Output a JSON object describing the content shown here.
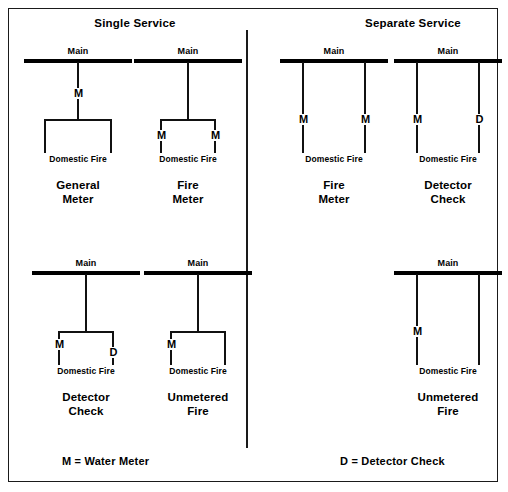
{
  "frame": {
    "border_color": "#1a1a1a",
    "background": "#ffffff"
  },
  "headers": {
    "single": "Single Service",
    "separate": "Separate Service"
  },
  "legend": {
    "meter": "M = Water Meter",
    "detector": "D = Detector Check"
  },
  "labels": {
    "main": "Main",
    "domestic_fire": "Domestic Fire",
    "meter_badge": "M",
    "detector_badge": "D"
  },
  "diagrams": [
    {
      "id": "general-meter",
      "group": "single",
      "caption_line1": "General",
      "caption_line2": "Meter",
      "main_label": "Main",
      "leg_caption": "Domestic Fire",
      "topology": "single-drop-split",
      "badges": [
        "M"
      ]
    },
    {
      "id": "fire-meter-single",
      "group": "single",
      "caption_line1": "Fire",
      "caption_line2": "Meter",
      "main_label": "Main",
      "leg_caption": "Domestic Fire",
      "topology": "single-drop-split",
      "badges": [
        "M",
        "M"
      ]
    },
    {
      "id": "fire-meter-separate",
      "group": "separate",
      "caption_line1": "Fire",
      "caption_line2": "Meter",
      "main_label": "Main",
      "leg_caption": "Domestic Fire",
      "topology": "two-independent-drops",
      "badges": [
        "M",
        "M"
      ]
    },
    {
      "id": "detector-check-separate",
      "group": "separate",
      "caption_line1": "Detector",
      "caption_line2": "Check",
      "main_label": "Main",
      "leg_caption": "Domestic Fire",
      "topology": "two-independent-drops",
      "badges": [
        "M",
        "D"
      ]
    },
    {
      "id": "detector-check-single",
      "group": "single",
      "caption_line1": "Detector",
      "caption_line2": "Check",
      "main_label": "Main",
      "leg_caption": "Domestic Fire",
      "topology": "single-drop-split",
      "badges": [
        "M",
        "D"
      ]
    },
    {
      "id": "unmetered-fire-single",
      "group": "single",
      "caption_line1": "Unmetered",
      "caption_line2": "Fire",
      "main_label": "Main",
      "leg_caption": "Domestic Fire",
      "topology": "single-drop-split",
      "badges": [
        "M"
      ]
    },
    {
      "id": "unmetered-fire-separate",
      "group": "separate",
      "caption_line1": "Unmetered",
      "caption_line2": "Fire",
      "main_label": "Main",
      "leg_caption": "Domestic Fire",
      "topology": "two-independent-drops",
      "badges": [
        "M"
      ]
    }
  ]
}
